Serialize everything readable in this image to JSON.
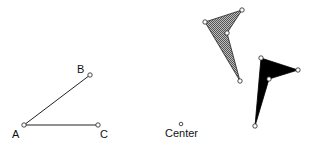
{
  "labels": {
    "a": "A",
    "b": "B",
    "c": "C",
    "center": "Center"
  },
  "angle": {
    "A": [
      24,
      125
    ],
    "B": [
      90,
      75
    ],
    "C": [
      98,
      125
    ]
  },
  "center_point": [
    180,
    124
  ],
  "shapes": [
    {
      "name": "original-shape",
      "fill": "hatched-gray",
      "points": [
        [
          205,
          22
        ],
        [
          242,
          10
        ],
        [
          227,
          33
        ],
        [
          240,
          81
        ]
      ]
    },
    {
      "name": "rotated-shape",
      "fill": "#000000",
      "points": [
        [
          261,
          58
        ],
        [
          298,
          70
        ],
        [
          269,
          79
        ],
        [
          255,
          126
        ]
      ]
    }
  ],
  "colors": {
    "stroke": "#222222",
    "gray_fill": "#8a8a8a",
    "black_fill": "#000000"
  }
}
